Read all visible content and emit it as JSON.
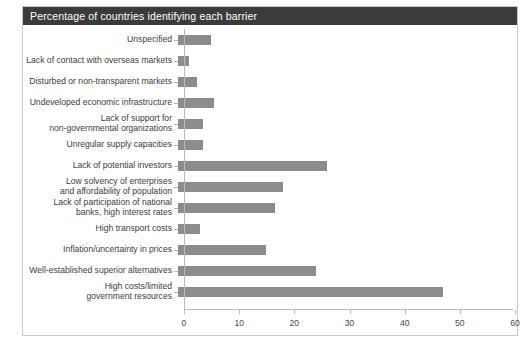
{
  "clipped_top_text": "",
  "figure": {
    "header_title": "Percentage of countries identifying each barrier"
  },
  "chart_data": {
    "type": "bar",
    "orientation": "horizontal",
    "title": "Percentage of countries identifying each barrier",
    "xlabel": "",
    "ylabel": "",
    "xlim": [
      0,
      60
    ],
    "xticks": [
      0,
      10,
      20,
      30,
      40,
      50,
      60
    ],
    "xtick_labels": [
      "0",
      "10",
      "20",
      "30",
      "40",
      "50",
      "60"
    ],
    "grid": false,
    "legend": null,
    "bar_color": "#8c8c8c",
    "categories": [
      "Unspecified",
      "Lack of contact with overseas markets",
      "Disturbed or non-transparent markets",
      "Undeveloped economic infrastructure",
      "Lack of support for\nnon-governmental organizations",
      "Unregular supply capacities",
      "Lack of potential investors",
      "Low solvency of enterprises\nand affordability of population",
      "Lack of participation of national\nbanks, high interest rates",
      "High transport costs",
      "Inflation/uncertainty in prices",
      "Well-established superior alternatives",
      "High costs/limited\ngovernment resources"
    ],
    "values": [
      6,
      2,
      3.5,
      6.5,
      4.5,
      4.5,
      27,
      19,
      17.5,
      4,
      16,
      25,
      48
    ]
  },
  "colors": {
    "header_background": "#3b3b3b",
    "header_text": "#ffffff",
    "bar": "#8c8c8c",
    "axis": "#b9b9b9",
    "label_text": "#3c3c3c",
    "frame_border": "#c9c9c9",
    "page_background": "#ffffff"
  }
}
